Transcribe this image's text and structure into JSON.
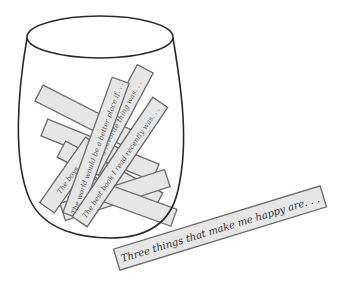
{
  "illustration": {
    "subject": "memory jar with paper prompt strips",
    "colors": {
      "background": "#ffffff",
      "strip_fill": "#e6e6e6",
      "strip_stroke": "#6a6a6a",
      "jar_outline": "#2a2a2a",
      "text": "#555555"
    },
    "jar_strips": [
      {
        "text": "The best book I read recently was. . ."
      },
      {
        "text": "The world would be a better place if. . ."
      },
      {
        "text": "The boys. . ."
      },
      {
        "text": "My favorite thing was. . ."
      }
    ],
    "loose_strip": {
      "text": "Three things that make me happy are. . ."
    }
  }
}
